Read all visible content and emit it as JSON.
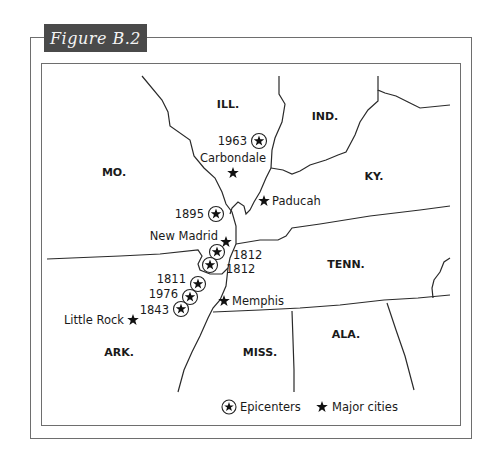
{
  "figure": {
    "title": "Figure B.2"
  },
  "states": [
    {
      "id": "ill",
      "label": "ILL.",
      "x": 228,
      "y": 108
    },
    {
      "id": "ind",
      "label": "IND.",
      "x": 325,
      "y": 120
    },
    {
      "id": "mo",
      "label": "MO.",
      "x": 114,
      "y": 176
    },
    {
      "id": "ky",
      "label": "KY.",
      "x": 374,
      "y": 180
    },
    {
      "id": "tenn",
      "label": "TENN.",
      "x": 346,
      "y": 268
    },
    {
      "id": "ark",
      "label": "ARK.",
      "x": 119,
      "y": 356
    },
    {
      "id": "miss",
      "label": "MISS.",
      "x": 260,
      "y": 356
    },
    {
      "id": "ala",
      "label": "ALA.",
      "x": 346,
      "y": 338
    }
  ],
  "epicenters": [
    {
      "year": "1963",
      "cx": 259,
      "cy": 141,
      "lx": 247,
      "ly": 145,
      "anchor": "end"
    },
    {
      "year": "1895",
      "cx": 216,
      "cy": 214,
      "lx": 204,
      "ly": 218,
      "anchor": "end"
    },
    {
      "year": "1812",
      "cx": 217,
      "cy": 252,
      "lx": 233,
      "ly": 259,
      "anchor": "start"
    },
    {
      "year": "1812",
      "cx": 210,
      "cy": 265,
      "lx": 226,
      "ly": 273,
      "anchor": "start"
    },
    {
      "year": "1811",
      "cx": 198,
      "cy": 284,
      "lx": 186,
      "ly": 283,
      "anchor": "end"
    },
    {
      "year": "1976",
      "cx": 190,
      "cy": 297,
      "lx": 178,
      "ly": 298,
      "anchor": "end"
    },
    {
      "year": "1843",
      "cx": 181,
      "cy": 309,
      "lx": 169,
      "ly": 314,
      "anchor": "end"
    }
  ],
  "cities": [
    {
      "name": "Carbondale",
      "sx": 233,
      "sy": 173,
      "lx": 233,
      "ly": 162,
      "anchor": "middle"
    },
    {
      "name": "Paducah",
      "sx": 264,
      "sy": 201,
      "lx": 272,
      "ly": 205,
      "anchor": "start"
    },
    {
      "name": "New Madrid",
      "sx": 226,
      "sy": 242,
      "lx": 218,
      "ly": 240,
      "anchor": "end"
    },
    {
      "name": "Memphis",
      "sx": 224,
      "sy": 301,
      "lx": 232,
      "ly": 305,
      "anchor": "start"
    },
    {
      "name": "Little Rock",
      "sx": 133,
      "sy": 320,
      "lx": 124,
      "ly": 324,
      "anchor": "end"
    }
  ],
  "legend": {
    "epicenters_label": "Epicenters",
    "major_cities_label": "Major cities"
  },
  "colors": {
    "title_bg": "#4a4a4a",
    "frame": "#6e6e6e",
    "lines": "#2a2a2a",
    "text": "#1a1a1a"
  }
}
